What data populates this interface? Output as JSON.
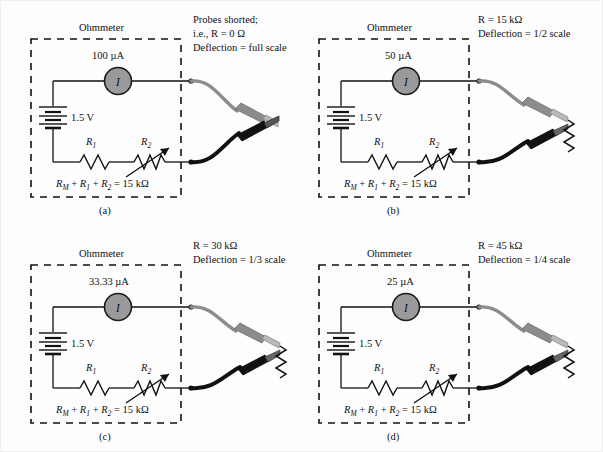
{
  "figure": {
    "background_color": "#fdfdfd",
    "line_color": "#111111",
    "meter_fill_color": "#9a9a9a",
    "probe_red_color": "#8c8c8c",
    "probe_black_color": "#111111"
  },
  "common": {
    "ohmmeter_title": "Ohmmeter",
    "battery_label": "1.5 V",
    "meter_symbol": "I",
    "r1_label": "R",
    "r1_sub": "1",
    "r2_label": "R",
    "r2_sub": "2",
    "formula": "RM + R₁ + R₂ = 15  kΩ",
    "formula_parts": {
      "rm": "R",
      "rm_sub": "M",
      "plus": "+",
      "r1": "R",
      "r1_sub": "1",
      "r2": "R",
      "r2_sub": "2",
      "equals": "=",
      "value": "15  kΩ"
    }
  },
  "panels": [
    {
      "id": "a",
      "letter": "(a)",
      "current": "100  µA",
      "note_lines": [
        "Probes shorted;",
        "i.e.,  R = 0  Ω",
        "Deflection = full scale"
      ],
      "external_resistance": "0 Ω",
      "deflection": "full scale",
      "probes_shorted": true,
      "external_resistor_visible": false
    },
    {
      "id": "b",
      "letter": "(b)",
      "current": "50  µA",
      "note_lines": [
        "R = 15  kΩ",
        "Deflection = 1/2 scale"
      ],
      "external_resistance": "15 kΩ",
      "deflection": "1/2 scale",
      "probes_shorted": false,
      "external_resistor_visible": true
    },
    {
      "id": "c",
      "letter": "(c)",
      "current": "33.33  µA",
      "note_lines": [
        "R = 30  kΩ",
        "Deflection = 1/3 scale"
      ],
      "external_resistance": "30 kΩ",
      "deflection": "1/3 scale",
      "probes_shorted": false,
      "external_resistor_visible": true
    },
    {
      "id": "d",
      "letter": "(d)",
      "current": "25  µA",
      "note_lines": [
        "R = 45  kΩ",
        "Deflection = 1/4 scale"
      ],
      "external_resistance": "45 kΩ",
      "deflection": "1/4 scale",
      "probes_shorted": false,
      "external_resistor_visible": true
    }
  ]
}
